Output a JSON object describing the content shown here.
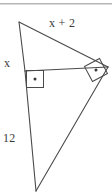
{
  "figure": {
    "background_color": "#ffffff",
    "stroke_color": "#4a4a4a",
    "text_color": "#3a3a3a",
    "width": 112,
    "height": 193,
    "labels": {
      "hypotenuse": "x + 2",
      "upper_leg": "x",
      "lower_leg": "12"
    },
    "rule": {
      "color": "#b4b4b4"
    },
    "vertices": {
      "top": "19,22",
      "right": "108,67",
      "bottom": "36,191",
      "foot": "25,71"
    },
    "right_angles": [
      "inner-foot-right-angle",
      "outer-vertex-right-angle"
    ]
  }
}
